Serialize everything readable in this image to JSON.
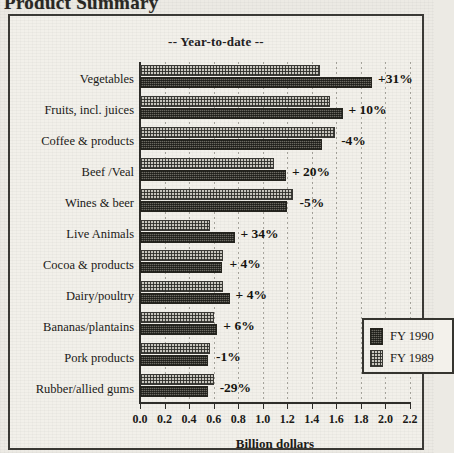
{
  "document": {
    "title": "Product Summary"
  },
  "legend": {
    "position": "inside-right-lower",
    "entries": [
      {
        "key": "fy1990",
        "label": "FY 1990",
        "swatch": "dark-hatch-swatch"
      },
      {
        "key": "fy1989",
        "label": "FY 1989",
        "swatch": "light-checker-swatch"
      }
    ]
  },
  "chart_data": {
    "type": "bar",
    "orientation": "horizontal",
    "title": "-- Year-to-date --",
    "xlabel": "Billion dollars",
    "ylabel": "",
    "xlim": [
      0.0,
      2.2
    ],
    "xticks": [
      "0.0",
      "0.2",
      "0.4",
      "0.6",
      "0.8",
      "1.0",
      "1.2",
      "1.4",
      "1.6",
      "1.8",
      "2.0",
      "2.2"
    ],
    "xtick_values": [
      0.0,
      0.2,
      0.4,
      0.6,
      0.8,
      1.0,
      1.2,
      1.4,
      1.6,
      1.8,
      2.0,
      2.2
    ],
    "grid": true,
    "grid_axis": "x",
    "legend_position": "lower-right-inside",
    "categories": [
      "Vegetables",
      "Fruits, incl. juices",
      "Coffee & products",
      "Beef /Veal",
      "Wines & beer",
      "Live Animals",
      "Cocoa & products",
      "Dairy/poultry",
      "Bananas/plantains",
      "Pork products",
      "Rubber/allied gums"
    ],
    "series": [
      {
        "name": "FY 1989",
        "values": [
          1.47,
          1.55,
          1.59,
          1.09,
          1.25,
          0.57,
          0.68,
          0.68,
          0.6,
          0.57,
          0.6
        ]
      },
      {
        "name": "FY 1990",
        "values": [
          1.89,
          1.65,
          1.48,
          1.19,
          1.2,
          0.77,
          0.67,
          0.73,
          0.63,
          0.55,
          0.55
        ]
      }
    ],
    "annotations": [
      "+31%",
      "+ 10%",
      "-4%",
      "+ 20%",
      "-5%",
      "+ 34%",
      "+ 4%",
      "+ 4%",
      "+ 6%",
      "-1%",
      "-29%"
    ]
  }
}
